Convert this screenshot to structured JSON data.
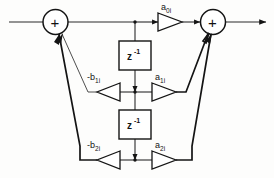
{
  "diagram": {
    "type": "signal-flow-graph",
    "nodes": {
      "sum_left": {
        "symbol": "+",
        "name": "input-summing-junction"
      },
      "sum_right": {
        "symbol": "+",
        "name": "output-summing-junction"
      },
      "delay_1": {
        "label_base": "z",
        "label_exp": "-1"
      },
      "delay_2": {
        "label_base": "z",
        "label_exp": "-1"
      }
    },
    "gains": {
      "a0": {
        "base": "a",
        "sub": "0",
        "idx": "i",
        "full": "a0i"
      },
      "a1": {
        "base": "a",
        "sub": "1",
        "idx": "i",
        "full": "a1i"
      },
      "a2": {
        "base": "a",
        "sub": "2",
        "idx": "i",
        "full": "a2i"
      },
      "b1": {
        "base": "-b",
        "sub": "1",
        "idx": "i",
        "full": "-b1i"
      },
      "b2": {
        "base": "-b",
        "sub": "2",
        "idx": "i",
        "full": "-b2i"
      }
    },
    "colors": {
      "line": "#2a2a2a",
      "line_bold": "#141414",
      "text": "#141414",
      "background": "#fdfdfc",
      "shape_fill": "#ffffff"
    }
  }
}
